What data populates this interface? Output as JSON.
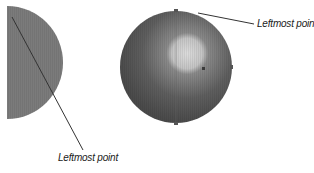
{
  "diagram": {
    "left_figure": {
      "shape": "half-circle",
      "fill": "#7a7a7a",
      "label": "Leftmost point"
    },
    "right_figure": {
      "shape": "sphere",
      "base_color": "#555555",
      "highlight_color": "#d8d8d8",
      "label": "Leftmost point"
    },
    "line_color": "#333333"
  }
}
